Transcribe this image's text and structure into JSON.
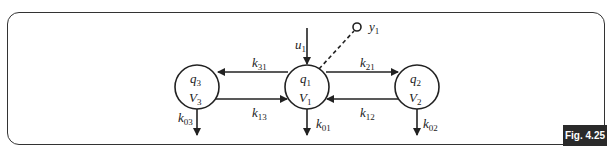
{
  "figure_label": "Fig. 4.25",
  "compartments": [
    {
      "id": "q3",
      "quantity": "q",
      "quantity_sub": "3",
      "volume": "V",
      "volume_sub": "3"
    },
    {
      "id": "q1",
      "quantity": "q",
      "quantity_sub": "1",
      "volume": "V",
      "volume_sub": "1"
    },
    {
      "id": "q2",
      "quantity": "q",
      "quantity_sub": "2",
      "volume": "V",
      "volume_sub": "2"
    }
  ],
  "rates": {
    "k31": {
      "base": "k",
      "sub": "31"
    },
    "k13": {
      "base": "k",
      "sub": "13"
    },
    "k21": {
      "base": "k",
      "sub": "21"
    },
    "k12": {
      "base": "k",
      "sub": "12"
    },
    "k03": {
      "base": "k",
      "sub": "03"
    },
    "k01": {
      "base": "k",
      "sub": "01"
    },
    "k02": {
      "base": "k",
      "sub": "02"
    }
  },
  "input": {
    "base": "u",
    "sub": "1"
  },
  "output": {
    "base": "y",
    "sub": "1"
  }
}
